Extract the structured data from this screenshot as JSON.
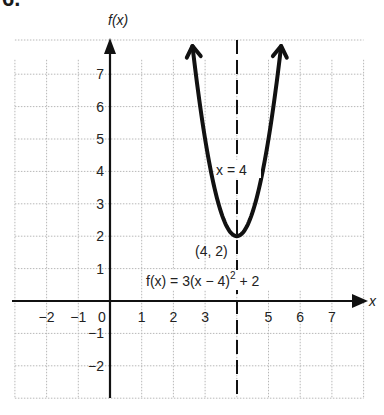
{
  "problem_number": "6.",
  "chart_data": {
    "type": "line",
    "title": "",
    "function": "f(x) = 3(x - 4)^2 + 2",
    "xlabel": "x",
    "ylabel": "f(x)",
    "xlim": [
      -3,
      8
    ],
    "ylim": [
      -3,
      8
    ],
    "grid": true,
    "x_ticks": [
      "-2",
      "-1",
      "0",
      "1",
      "2",
      "3",
      "5",
      "6",
      "7"
    ],
    "y_ticks": [
      "7",
      "6",
      "5",
      "4",
      "3",
      "2",
      "1",
      "-1",
      "-2"
    ],
    "series": [
      {
        "name": "f(x) = 3(x - 4)^2 + 2",
        "x": [
          2.4,
          3,
          3.5,
          4,
          4.5,
          5,
          5.6
        ],
        "y": [
          9.68,
          5,
          2.75,
          2,
          2.75,
          5,
          9.68
        ]
      }
    ],
    "annotations": {
      "vertex": {
        "label": "(4, 2)",
        "x": 4,
        "y": 2
      },
      "axis_of_symmetry": {
        "label": "x = 4",
        "x": 4,
        "style": "dashed"
      },
      "equation_label": {
        "prefix": "f(x) = 3(x − 4)",
        "exponent": "2",
        "suffix": " + 2"
      }
    }
  },
  "labels": {
    "y_axis": "f(x)",
    "x_axis": "x",
    "vertex": "(4, 2)",
    "symmetry": "x = 4"
  }
}
